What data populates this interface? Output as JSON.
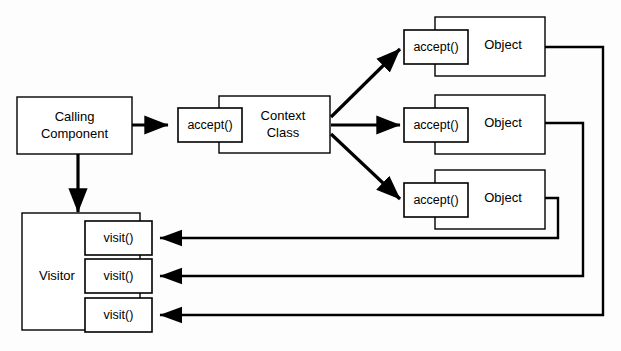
{
  "diagram": {
    "background_color": "#fdfdfd",
    "line_color": "#000000",
    "box_fill_color": "#ffffff",
    "caller": {
      "label_line1": "Calling",
      "label_line2": "Component"
    },
    "context": {
      "label_line1": "Context",
      "label_line2": "Class",
      "operation": "accept()"
    },
    "objects": [
      {
        "label": "Object",
        "operation": "accept()"
      },
      {
        "label": "Object",
        "operation": "accept()"
      },
      {
        "label": "Object",
        "operation": "accept()"
      }
    ],
    "visitor": {
      "label": "Visitor",
      "operations": [
        "visit()",
        "visit()",
        "visit()"
      ]
    }
  }
}
